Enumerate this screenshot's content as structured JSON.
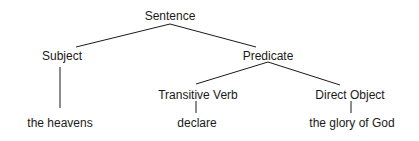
{
  "diagram": {
    "type": "syntax-tree",
    "line_color": "#1a1a1a",
    "nodes": {
      "root": {
        "label": "Sentence",
        "x": 170,
        "y": 9
      },
      "subject": {
        "label": "Subject",
        "x": 62,
        "y": 49
      },
      "predicate": {
        "label": "Predicate",
        "x": 268,
        "y": 49
      },
      "transitive_verb": {
        "label": "Transitive Verb",
        "x": 198,
        "y": 88
      },
      "direct_object": {
        "label": "Direct Object",
        "x": 350,
        "y": 88
      },
      "subject_leaf": {
        "label": "the heavens",
        "x": 60,
        "y": 115
      },
      "verb_leaf": {
        "label": "declare",
        "x": 197,
        "y": 115
      },
      "object_leaf": {
        "label": "the glory of God",
        "x": 352,
        "y": 115
      }
    },
    "edges": [
      {
        "from": "root",
        "to": "subject"
      },
      {
        "from": "root",
        "to": "predicate"
      },
      {
        "from": "subject",
        "to": "subject_leaf"
      },
      {
        "from": "predicate",
        "to": "transitive_verb"
      },
      {
        "from": "predicate",
        "to": "direct_object"
      },
      {
        "from": "transitive_verb",
        "to": "verb_leaf"
      },
      {
        "from": "direct_object",
        "to": "object_leaf"
      }
    ]
  }
}
